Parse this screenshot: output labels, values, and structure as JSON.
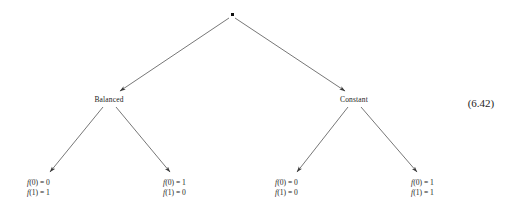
{
  "figure": {
    "type": "decision-tree-diagram",
    "equation_number": "(6.42)",
    "background_color": "#ffffff",
    "ink_color": "#1d1d1d"
  },
  "root": {
    "marker": "filled-dot",
    "label": "",
    "x": 232,
    "y": 15
  },
  "branch_nodes": [
    {
      "id": "balanced",
      "label": "Balanced",
      "x": 109,
      "y": 99
    },
    {
      "id": "constant",
      "label": "Constant",
      "x": 354,
      "y": 99
    }
  ],
  "leaves": [
    {
      "id": "leaf-balanced-left",
      "parent": "balanced",
      "lines": [
        "f(0) = 0",
        "f(1) = 1"
      ],
      "line1_fn": "f",
      "line1_rest": "(0) = 0",
      "line2_fn": "f",
      "line2_rest": "(1) = 1",
      "x": 27,
      "y": 180
    },
    {
      "id": "leaf-balanced-right",
      "parent": "balanced",
      "lines": [
        "f(0) = 1",
        "f(1) = 0"
      ],
      "line1_fn": "f",
      "line1_rest": "(0) = 1",
      "line2_fn": "f",
      "line2_rest": "(1) = 0",
      "x": 163,
      "y": 180
    },
    {
      "id": "leaf-constant-left",
      "parent": "constant",
      "lines": [
        "f(0) = 0",
        "f(1) = 0"
      ],
      "line1_fn": "f",
      "line1_rest": "(0) = 0",
      "line2_fn": "f",
      "line2_rest": "(1) = 0",
      "x": 275,
      "y": 180
    },
    {
      "id": "leaf-constant-right",
      "parent": "constant",
      "lines": [
        "f(0) = 1",
        "f(1) = 1"
      ],
      "line1_fn": "f",
      "line1_rest": "(0) = 1",
      "line2_fn": "f",
      "line2_rest": "(1) = 1",
      "x": 411,
      "y": 180
    }
  ],
  "edges": [
    {
      "id": "root-to-balanced",
      "from": "root",
      "to": "balanced"
    },
    {
      "id": "root-to-constant",
      "from": "root",
      "to": "constant"
    },
    {
      "id": "balanced-to-leaf1",
      "from": "balanced",
      "to": "leaf-balanced-left"
    },
    {
      "id": "balanced-to-leaf2",
      "from": "balanced",
      "to": "leaf-balanced-right"
    },
    {
      "id": "constant-to-leaf3",
      "from": "constant",
      "to": "leaf-constant-left"
    },
    {
      "id": "constant-to-leaf4",
      "from": "constant",
      "to": "leaf-constant-right"
    }
  ]
}
